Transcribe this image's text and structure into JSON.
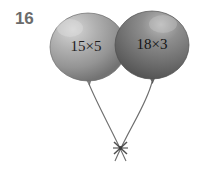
{
  "problem": {
    "number": "16",
    "type": "balloon-expressions"
  },
  "balloons": [
    {
      "id": "balloon-left",
      "expression": "15×5",
      "operand_a": 15,
      "operand_b": 5,
      "operator": "×",
      "product": 75,
      "fill_color": "#9a9a9a",
      "highlight_color": "#d2d2d2",
      "shadow_color": "#6f6f6f",
      "center_x": 88,
      "center_y": 47,
      "radius_x": 38,
      "radius_y": 34
    },
    {
      "id": "balloon-right",
      "expression": "18×3",
      "operand_a": 18,
      "operand_b": 3,
      "operator": "×",
      "product": 54,
      "fill_color": "#7b7b7b",
      "highlight_color": "#b4b4b4",
      "shadow_color": "#4e4e4e",
      "center_x": 152,
      "center_y": 45,
      "radius_x": 37,
      "radius_y": 34
    }
  ],
  "strings": {
    "color": "#6e6e6e",
    "knot_x": 120,
    "knot_y": 148,
    "knot_label": "string-knot"
  },
  "colors": {
    "page_background": "#ffffff",
    "number_color": "#6b6b6b",
    "text_color": "#1d1d1d"
  }
}
